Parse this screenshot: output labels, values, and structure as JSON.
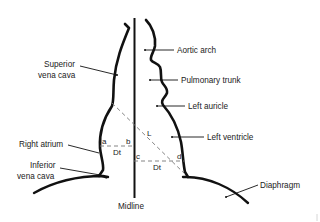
{
  "diagram": {
    "type": "anatomical-schematic",
    "colors": {
      "background": "#ffffff",
      "outline": "#111111",
      "text": "#222222",
      "dashed": "#777777"
    },
    "labels": {
      "superior_vena_cava_line1": "Superior",
      "superior_vena_cava_line2": "vena cava",
      "aortic_arch": "Aortic arch",
      "pulmonary_trunk": "Pulmonary trunk",
      "left_auricle": "Left auricle",
      "right_atrium": "Right atrium",
      "left_ventricle": "Left ventricle",
      "inferior_vena_cava_line1": "Inferior",
      "inferior_vena_cava_line2": "vena cava",
      "diaphragm": "Diaphragm",
      "midline": "Midline"
    },
    "measurement_points": {
      "a": "a",
      "b": "b",
      "c": "c",
      "d": "d"
    },
    "measurements": {
      "long_axis": "L",
      "transverse_right": "Dt",
      "transverse_left": "Dt"
    }
  }
}
